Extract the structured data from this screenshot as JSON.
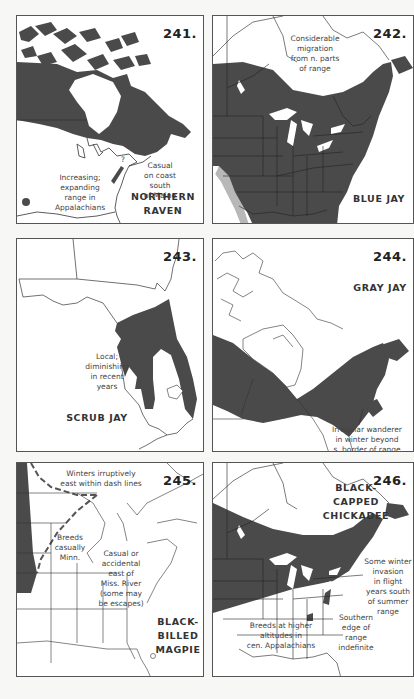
{
  "colors": {
    "page_background": "#f7f7f5",
    "map_background": "#ffffff",
    "range_fill": "#4a4a4a",
    "secondary_range_fill": "#b8b8b8",
    "line": "#333333"
  },
  "maps": [
    {
      "number": "241.",
      "species": "NORTHERN RAVEN",
      "species_lines": [
        "NORTHERN",
        "RAVEN"
      ],
      "notes": [
        {
          "text": "Increasing;\nexpanding\nrange in\nAppalachians"
        },
        {
          "text": "Casual\non coast\nsouth\nof Maine"
        },
        {
          "text": "?"
        }
      ]
    },
    {
      "number": "242.",
      "species": "BLUE JAY",
      "species_lines": [
        "BLUE JAY"
      ],
      "notes": [
        {
          "text": "Considerable\nmigration\nfrom n. parts\nof range"
        }
      ]
    },
    {
      "number": "243.",
      "species": "SCRUB JAY",
      "species_lines": [
        "SCRUB JAY"
      ],
      "notes": [
        {
          "text": "Local;\ndiminishing\nin recent\nyears"
        }
      ]
    },
    {
      "number": "244.",
      "species": "GRAY JAY",
      "species_lines": [
        "GRAY JAY"
      ],
      "notes": [
        {
          "text": "Irregular wanderer\nin winter beyond\ns. border of range"
        }
      ]
    },
    {
      "number": "245.",
      "species": "BLACK-BILLED MAGPIE",
      "species_lines": [
        "BLACK-",
        "BILLED",
        "MAGPIE"
      ],
      "notes": [
        {
          "text": "Winters irruptively\neast within dash lines"
        },
        {
          "text": "Breeds\ncasually\nMinn."
        },
        {
          "text": "Casual or\naccidental\neast of\nMiss. River\n(some may\nbe escapes)"
        }
      ]
    },
    {
      "number": "246.",
      "species": "BLACK-CAPPED CHICKADEE",
      "species_lines": [
        "BLACK-",
        "CAPPED",
        "CHICKADEE"
      ],
      "notes": [
        {
          "text": "Some winter\ninvasion\nin flight\nyears south\nof summer\nrange"
        },
        {
          "text": "Southern\nedge of\nrange\nindefinite"
        },
        {
          "text": "Breeds at higher\naltitudes in\ncen. Appalachians"
        }
      ]
    }
  ]
}
